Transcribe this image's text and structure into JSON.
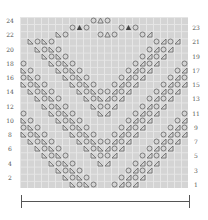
{
  "chart": {
    "title": "",
    "rows": 24,
    "cols": 24,
    "left_labels": [
      "24",
      "22",
      "20",
      "18",
      "16",
      "14",
      "12",
      "10",
      "8",
      "6",
      "4",
      "2"
    ],
    "right_labels": [
      "23",
      "21",
      "19",
      "17",
      "15",
      "13",
      "11",
      "9",
      "7",
      "5",
      "3",
      "1"
    ],
    "symbols": {
      "yo": "circle-yarn-over",
      "ssk": "ssk-left-decrease",
      "k2tog": "k2tog-right-decrease",
      "cdd": "central-double-decrease",
      "sk2p": "open-triangle-decrease"
    },
    "colors": {
      "grid_bg": "#d4d4d4",
      "grid_line": "#e6e6e6",
      "symbol": "#666666",
      "cdd": "#444444",
      "label": "#555555"
    },
    "special_rows": {
      "24": [
        [
          10,
          "yo"
        ],
        [
          11,
          "sk2p"
        ],
        [
          12,
          "yo"
        ]
      ],
      "23": [
        [
          7,
          "yo"
        ],
        [
          8,
          "cdd"
        ],
        [
          9,
          "yo"
        ],
        [
          14,
          "yo"
        ],
        [
          15,
          "cdd"
        ],
        [
          16,
          "yo"
        ]
      ],
      "22": [
        [
          5,
          "ssk"
        ],
        [
          6,
          "yo"
        ],
        [
          11,
          "yo"
        ],
        [
          12,
          "sk2p"
        ],
        [
          13,
          "yo"
        ],
        [
          17,
          "yo"
        ],
        [
          18,
          "k2tog"
        ]
      ]
    },
    "left_diag_starts": [
      8,
      15,
      22
    ],
    "repeat_len": 4
  },
  "bracket": {
    "label": ""
  }
}
